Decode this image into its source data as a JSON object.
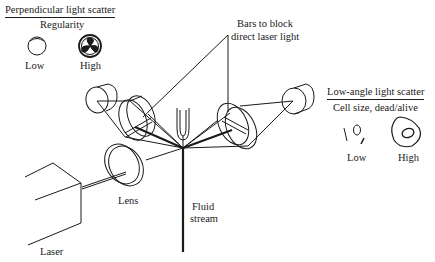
{
  "diagram": {
    "type": "flow cytometry optical layout",
    "perpendicular": {
      "title": "Perpendicular light scatter",
      "subtitle": "Regularity",
      "low_label": "Low",
      "high_label": "High",
      "low_icon": "empty-circle-cell-icon",
      "high_icon": "granular-cell-icon"
    },
    "low_angle": {
      "title": "Low-angle light scatter",
      "subtitle": "Cell size, dead/alive",
      "low_label": "Low",
      "high_label": "High",
      "low_icon": "small-debris-icon",
      "high_icon": "large-cell-icon"
    },
    "labels": {
      "bars_line1": "Bars to block",
      "bars_line2": "direct laser light",
      "lens": "Lens",
      "fluid_line1": "Fluid",
      "fluid_line2": "stream",
      "laser": "Laser"
    },
    "colors": {
      "ink": "#1a1a1a",
      "background": "#ffffff"
    }
  }
}
